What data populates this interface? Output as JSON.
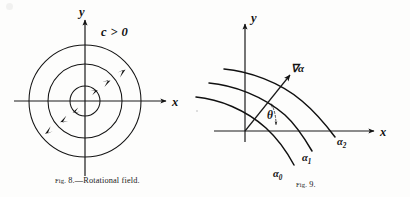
{
  "page": {
    "background_color": "#fdfdfc",
    "ink_color": "#141414",
    "width": 410,
    "height": 197
  },
  "figures": [
    {
      "id": "fig8",
      "caption_prefix": "Fig.",
      "caption_number": "8.",
      "caption_text": "—Rotational field.",
      "caption_full": "Fig. 8.—Rotational field.",
      "axes": {
        "x_label": "x",
        "y_label": "y",
        "origin": [
          85,
          101
        ]
      },
      "annotation": "c > 0",
      "annotation_parts": {
        "symbol": "c",
        "relation": ">",
        "value": "0"
      },
      "field_type": "rotational",
      "rotation_sense": "counterclockwise",
      "circles": [
        {
          "name": "inner-circle",
          "radius": 15
        },
        {
          "name": "middle-circle",
          "radius": 37
        },
        {
          "name": "outer-circle",
          "radius": 56
        }
      ],
      "arrow_count": 6
    },
    {
      "id": "fig9",
      "caption_prefix": "Fig.",
      "caption_number": "9.",
      "caption_text": "",
      "caption_full": "Fig. 9.",
      "axes": {
        "x_label": "x",
        "y_label": "y",
        "origin": [
          245,
          131
        ]
      },
      "gradient_label": "∇α",
      "angle_label": "θ",
      "level_curves": [
        {
          "name": "level-curve-alpha0",
          "symbol": "α",
          "subscript": "0"
        },
        {
          "name": "level-curve-alpha1",
          "symbol": "α",
          "subscript": "1"
        },
        {
          "name": "level-curve-alpha2",
          "symbol": "α",
          "subscript": "2"
        }
      ]
    }
  ]
}
